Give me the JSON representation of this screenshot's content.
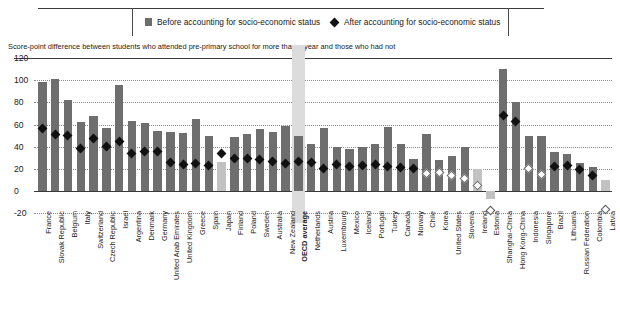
{
  "legend": {
    "before_label": "Before accounting for socio-economic status",
    "after_label": "After accounting for socio-economic status",
    "bar_swatch_icon": "square-swatch-icon",
    "diamond_swatch_icon": "diamond-marker-icon"
  },
  "subtitle": "Score-point difference between students who attended pre-primary school for more than a year and those who had not",
  "colors": {
    "bar": "#6e6e6e",
    "bar_light": "#c2c2c2",
    "marker": "#111111",
    "marker_hollow": "#ffffff",
    "highlight_band": "#dcdcdc",
    "axis": "#3a3a3a",
    "grid": "#8c8c8c"
  },
  "chart_data": {
    "type": "bar",
    "title": "",
    "subtitle": "Score-point difference between students who attended pre-primary school for more than a year and those who had not",
    "xlabel": "",
    "ylabel": "",
    "ylim": [
      -20,
      120
    ],
    "yticks": [
      -20,
      0,
      20,
      40,
      60,
      80,
      100,
      120
    ],
    "grid": true,
    "legend_position": "top",
    "highlight_category": "OECD average",
    "categories": [
      "France",
      "Slovak Republic",
      "Belgium",
      "Italy",
      "Switzerland",
      "Czech Republic",
      "Israel",
      "Argentina",
      "Denmark",
      "Germany",
      "United Arab Emirates",
      "United Kingdom",
      "Greece",
      "Spain",
      "Japan",
      "Finland",
      "Poland",
      "Sweden",
      "Australia",
      "New Zealand",
      "OECD average",
      "Netherlands",
      "Austria",
      "Luxembourg",
      "Mexico",
      "Iceland",
      "Portugal",
      "Turkey",
      "Canada",
      "Norway",
      "Chile",
      "Korea",
      "United States",
      "Slovenia",
      "Ireland",
      "Estonia",
      "Shanghai-China",
      "Hong Kong-China",
      "Indonesia",
      "Singapore",
      "Brazil",
      "Lithuania",
      "Russian Federation",
      "Colombia",
      "Latvia"
    ],
    "series": [
      {
        "name": "Before accounting for socio-economic status",
        "values": [
          98,
          101,
          82,
          62,
          68,
          57,
          96,
          63,
          61,
          54,
          53,
          52,
          65,
          50,
          26,
          49,
          51,
          56,
          53,
          59,
          50,
          42,
          57,
          40,
          38,
          40,
          42,
          58,
          42,
          29,
          51,
          28,
          32,
          40,
          20,
          -7,
          110,
          80,
          50,
          50,
          35,
          33,
          25,
          22,
          10
        ],
        "light_bars": [
          "Japan",
          "Ireland",
          "Estonia",
          "Latvia"
        ]
      },
      {
        "name": "After accounting for socio-economic status",
        "values": [
          56,
          51,
          50,
          38,
          47,
          40,
          45,
          34,
          36,
          36,
          26,
          24,
          25,
          23,
          34,
          29,
          29,
          28,
          27,
          25,
          27,
          26,
          20,
          24,
          22,
          23,
          24,
          22,
          21,
          20,
          16,
          17,
          14,
          11,
          5,
          -18,
          68,
          63,
          20,
          15,
          22,
          23,
          19,
          14,
          -17
        ],
        "hollow_markers": [
          "Chile",
          "United States",
          "Slovenia",
          "Ireland",
          "Estonia",
          "Indonesia",
          "Singapore",
          "Latvia",
          "Korea"
        ]
      }
    ]
  }
}
